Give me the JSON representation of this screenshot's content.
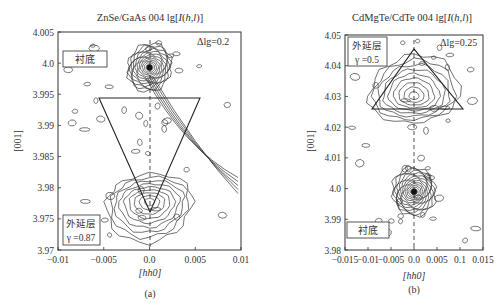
{
  "chart_data": [
    {
      "type": "contour",
      "panel_label": "(a)",
      "title": "ZnSe/GaAs 004 lg[I(h,l)]",
      "title_parts": {
        "prefix": "ZnSe/GaAs 004 lg[",
        "italic": "I",
        "mid": "(",
        "italic2": "h,l",
        "suffix": ")]"
      },
      "xlabel": "[hh0]",
      "ylabel": "[001]",
      "xlim": [
        -0.01,
        0.01
      ],
      "ylim": [
        3.97,
        4.005
      ],
      "xticks": [
        "-0.01",
        "-0.005",
        "0.0",
        "0.005",
        "0.01"
      ],
      "yticks": [
        "4.005",
        "4.0",
        "3.995",
        "3.99",
        "3.985",
        "3.98",
        "3.975",
        "3.97"
      ],
      "contour_step": "Δlg=0.2",
      "annotations": [
        {
          "text": "衬底",
          "meaning": "substrate",
          "peak": {
            "x": 0.0,
            "y": 3.9993
          }
        },
        {
          "text": "外延层",
          "meaning": "epilayer",
          "param": "γ =0.87",
          "peak": {
            "x": 0.0,
            "y": 3.9778
          }
        }
      ],
      "triangle": {
        "orientation": "down",
        "vertices": [
          [
            -0.0075,
            3.9815
          ],
          [
            0.0075,
            3.9815
          ],
          [
            0.0,
            3.9748
          ]
        ]
      },
      "streak": "diagonal analyzer streak from substrate peak toward lower right"
    },
    {
      "type": "contour",
      "panel_label": "(b)",
      "title": "CdMgTe/CdTe 004 lg[I(h,l)]",
      "title_parts": {
        "prefix": "CdMgTe/CdTe 004 lg[",
        "italic": "I",
        "mid": "(",
        "italic2": "h,l",
        "suffix": ")]"
      },
      "xlabel": "[hh0]",
      "ylabel": "[001]",
      "xlim": [
        -0.015,
        0.015
      ],
      "ylim": [
        3.98,
        4.05
      ],
      "xticks": [
        "-0.015",
        "-0.01",
        "-0.005",
        "0.0",
        "0.005",
        "0.1",
        "0.015"
      ],
      "yticks": [
        "4.05",
        "4.04",
        "4.03",
        "4.02",
        "4.01",
        "4.0",
        "3.99",
        "3.98"
      ],
      "contour_step": "Δlg=0.25",
      "annotations": [
        {
          "text": "外延层",
          "meaning": "epilayer",
          "param": "γ =0.5",
          "peak": {
            "x": 0.0,
            "y": 4.03
          }
        },
        {
          "text": "衬底",
          "meaning": "substrate",
          "peak": {
            "x": 0.0,
            "y": 3.999
          }
        }
      ],
      "triangle": {
        "orientation": "up",
        "vertices": [
          [
            -0.0085,
            4.0264
          ],
          [
            0.0105,
            4.0264
          ],
          [
            0.0,
            4.0455
          ]
        ]
      }
    }
  ],
  "panels": {
    "a": {
      "label": "(a)"
    },
    "b": {
      "label": "(b)"
    }
  }
}
